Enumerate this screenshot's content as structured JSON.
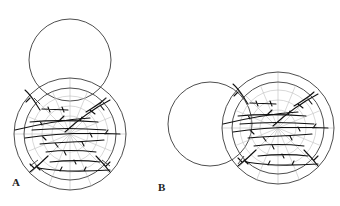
{
  "figure": {
    "panels": [
      {
        "id": "A",
        "label": "A",
        "label_pos": [
          12,
          185
        ]
      },
      {
        "id": "B",
        "label": "B",
        "label_pos": [
          158,
          190
        ]
      }
    ],
    "colors": {
      "outline": "#3a3a3a",
      "grid": "#b8b8b8",
      "vessel": "#111111",
      "background": "#ffffff"
    }
  }
}
